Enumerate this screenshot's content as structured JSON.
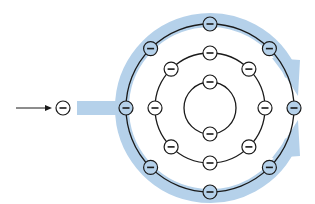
{
  "diagram": {
    "colors": {
      "background": "#ffffff",
      "flow_band": "#b5d1ea",
      "orbit_stroke": "#1a1a1a",
      "electron_fill": "#ffffff",
      "outer_electron_fill": "#b5d1ea",
      "electron_stroke": "#1a1a1a"
    },
    "nucleus_center": {
      "x": 210,
      "y": 108
    },
    "incoming": {
      "arrow": {
        "x1": 16,
        "y1": 108,
        "x2": 52,
        "y2": 108
      },
      "electron": {
        "x": 63,
        "y": 108,
        "label": "−"
      }
    },
    "shells": [
      {
        "name": "inner",
        "radius": 26,
        "electron_angles": [
          90,
          270
        ],
        "label": "−"
      },
      {
        "name": "middle",
        "radius": 55,
        "electron_angles": [
          0,
          45,
          90,
          135,
          180,
          225,
          270,
          315
        ],
        "label": "−"
      },
      {
        "name": "outer",
        "radius": 84,
        "electron_angles": [
          0,
          45,
          90,
          135,
          180,
          225,
          270,
          315
        ],
        "label": "−"
      }
    ],
    "flow": {
      "band_width": 14,
      "entry": {
        "x_start": 77,
        "y": 108
      },
      "arrowheads": [
        {
          "direction": "upper-path-to-right",
          "tip": {
            "x": 298,
            "y": 96
          }
        },
        {
          "direction": "lower-path-to-right",
          "tip": {
            "x": 298,
            "y": 122
          }
        }
      ]
    }
  }
}
